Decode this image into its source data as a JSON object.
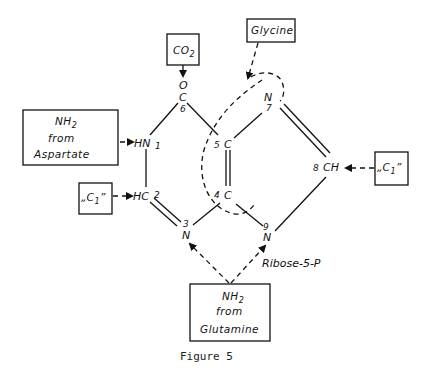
{
  "figure": {
    "caption": "Figure 5"
  },
  "sources": {
    "co2": {
      "main": "CO",
      "sub": "2"
    },
    "glycine": {
      "label": "Glycine"
    },
    "aspartate": {
      "line1_main": "NH",
      "line1_sub": "2",
      "line2": "from",
      "line3": "Aspartate"
    },
    "c1_left": {
      "main": "„C",
      "sub": "1",
      "close": "”"
    },
    "c1_right": {
      "main": "„C",
      "sub": "1",
      "close": "”"
    },
    "glutamine": {
      "line1_main": "NH",
      "line1_sub": "2",
      "line2": "from",
      "line3": "Glutamine"
    }
  },
  "ring_atoms": {
    "o": "O",
    "c6": {
      "atom": "C",
      "num": "6"
    },
    "n1": {
      "atom": "HN",
      "num": "1"
    },
    "c2": {
      "atom": "HC",
      "num": "2"
    },
    "n3": {
      "atom": "N",
      "num": "3"
    },
    "c4": {
      "atom": "C",
      "num": "4"
    },
    "c5": {
      "atom": "C",
      "num": "5"
    },
    "n7": {
      "atom": "N",
      "num": "7"
    },
    "c8": {
      "atom": "CH",
      "num": "8"
    },
    "n9": {
      "atom": "N",
      "num": "9"
    }
  },
  "substituent": {
    "label": "Ribose-5-P"
  }
}
